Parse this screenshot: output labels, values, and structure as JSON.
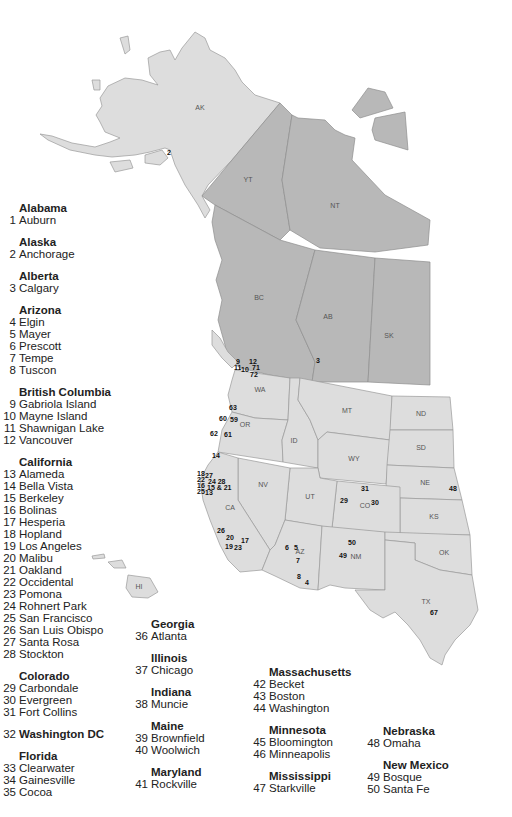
{
  "map": {
    "region_labels": {
      "AK": "AK",
      "YT": "YT",
      "NT": "NT",
      "BC": "BC",
      "AB": "AB",
      "SK": "SK",
      "WA": "WA",
      "OR": "OR",
      "ID": "ID",
      "MT": "MT",
      "WY": "WY",
      "ND": "ND",
      "SD": "SD",
      "NE": "NE",
      "KS": "KS",
      "CO": "CO",
      "UT": "UT",
      "NV": "NV",
      "CA": "CA",
      "AZ": "AZ",
      "NM": "NM",
      "OK": "OK",
      "TX": "TX",
      "HI": "HI"
    },
    "colors": {
      "us_fill": "#dddddd",
      "canada_fill": "#b8b8b8",
      "border": "#9a9a9a"
    },
    "markers": {
      "m2": "2",
      "m3": "3",
      "m9": "9",
      "m12": "12",
      "m11": "11",
      "m10": "10",
      "m71": "71",
      "m72": "72",
      "m63": "63",
      "m60": "60",
      "m59": "59",
      "m62": "62",
      "m61": "61",
      "m14": "14",
      "m18": "18",
      "m27": "27",
      "m22": "22",
      "m24_28": "24 28",
      "m16": "16",
      "m15_21": "15 & 21",
      "m25": "25",
      "m13": "13",
      "m26": "26",
      "m20": "20",
      "m17": "17",
      "m19": "19",
      "m23": "23",
      "m6": "6",
      "m5": "5",
      "m7": "7",
      "m8": "8",
      "m4": "4",
      "m29": "29",
      "m31": "31",
      "m30": "30",
      "m48": "48",
      "m50": "50",
      "m49": "49",
      "m67": "67"
    }
  },
  "legend": {
    "col1": [
      {
        "state": "Alabama",
        "cities": [
          {
            "n": "1",
            "name": "Auburn"
          }
        ]
      },
      {
        "state": "Alaska",
        "cities": [
          {
            "n": "2",
            "name": "Anchorage"
          }
        ]
      },
      {
        "state": "Alberta",
        "cities": [
          {
            "n": "3",
            "name": "Calgary"
          }
        ]
      },
      {
        "state": "Arizona",
        "cities": [
          {
            "n": "4",
            "name": "Elgin"
          },
          {
            "n": "5",
            "name": "Mayer"
          },
          {
            "n": "6",
            "name": "Prescott"
          },
          {
            "n": "7",
            "name": "Tempe"
          },
          {
            "n": "8",
            "name": "Tuscon"
          }
        ]
      },
      {
        "state": "British Columbia",
        "cities": [
          {
            "n": "9",
            "name": "Gabriola Island"
          },
          {
            "n": "10",
            "name": "Mayne Island"
          },
          {
            "n": "11",
            "name": "Shawnigan Lake"
          },
          {
            "n": "12",
            "name": "Vancouver"
          }
        ]
      },
      {
        "state": "California",
        "cities": [
          {
            "n": "13",
            "name": "Alameda"
          },
          {
            "n": "14",
            "name": "Bella Vista"
          },
          {
            "n": "15",
            "name": "Berkeley"
          },
          {
            "n": "16",
            "name": "Bolinas"
          },
          {
            "n": "17",
            "name": "Hesperia"
          },
          {
            "n": "18",
            "name": "Hopland"
          },
          {
            "n": "19",
            "name": "Los Angeles"
          },
          {
            "n": "20",
            "name": "Malibu"
          },
          {
            "n": "21",
            "name": "Oakland"
          },
          {
            "n": "22",
            "name": "Occidental"
          },
          {
            "n": "23",
            "name": "Pomona"
          },
          {
            "n": "24",
            "name": "Rohnert Park"
          },
          {
            "n": "25",
            "name": "San Francisco"
          },
          {
            "n": "26",
            "name": "San Luis Obispo"
          },
          {
            "n": "27",
            "name": "Santa Rosa"
          },
          {
            "n": "28",
            "name": "Stockton"
          }
        ]
      },
      {
        "state": "Colorado",
        "cities": [
          {
            "n": "29",
            "name": "Carbondale"
          },
          {
            "n": "30",
            "name": "Evergreen"
          },
          {
            "n": "31",
            "name": "Fort Collins"
          }
        ]
      },
      {
        "state": "",
        "standalone": {
          "n": "32",
          "name": "Washington DC"
        }
      },
      {
        "state": "Florida",
        "cities": [
          {
            "n": "33",
            "name": "Clearwater"
          },
          {
            "n": "34",
            "name": "Gainesville"
          },
          {
            "n": "35",
            "name": "Cocoa"
          }
        ]
      }
    ],
    "col2": [
      {
        "state": "Georgia",
        "cities": [
          {
            "n": "36",
            "name": "Atlanta"
          }
        ]
      },
      {
        "state": "Illinois",
        "cities": [
          {
            "n": "37",
            "name": "Chicago"
          }
        ]
      },
      {
        "state": "Indiana",
        "cities": [
          {
            "n": "38",
            "name": "Muncie"
          }
        ]
      },
      {
        "state": "Maine",
        "cities": [
          {
            "n": "39",
            "name": "Brownfield"
          },
          {
            "n": "40",
            "name": "Woolwich"
          }
        ]
      },
      {
        "state": "Maryland",
        "cities": [
          {
            "n": "41",
            "name": "Rockville"
          }
        ]
      }
    ],
    "col3": [
      {
        "state": "Massachusetts",
        "cities": [
          {
            "n": "42",
            "name": "Becket"
          },
          {
            "n": "43",
            "name": "Boston"
          },
          {
            "n": "44",
            "name": "Washington"
          }
        ]
      },
      {
        "state": "Minnesota",
        "cities": [
          {
            "n": "45",
            "name": "Bloomington"
          },
          {
            "n": "46",
            "name": "Minneapolis"
          }
        ]
      },
      {
        "state": "Mississippi",
        "cities": [
          {
            "n": "47",
            "name": "Starkville"
          }
        ]
      }
    ],
    "col4": [
      {
        "state": "Nebraska",
        "cities": [
          {
            "n": "48",
            "name": "Omaha"
          }
        ]
      },
      {
        "state": "New Mexico",
        "cities": [
          {
            "n": "49",
            "name": "Bosque"
          },
          {
            "n": "50",
            "name": "Santa Fe"
          }
        ]
      }
    ]
  }
}
